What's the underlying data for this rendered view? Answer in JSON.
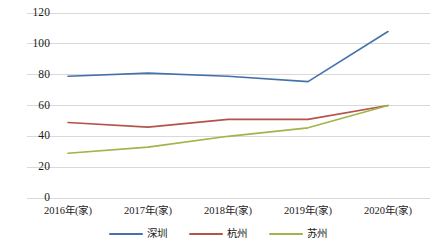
{
  "chart_data": {
    "type": "line",
    "title": "",
    "xlabel": "",
    "ylabel": "",
    "categories": [
      "2016年(家)",
      "2017年(家)",
      "2018年(家)",
      "2019年(家)",
      "2020年(家)"
    ],
    "series": [
      {
        "name": "深圳",
        "color": "#4472a8",
        "values": [
          79,
          81,
          79,
          75.5,
          108
        ]
      },
      {
        "name": "杭州",
        "color": "#b5534a",
        "values": [
          49,
          46,
          51,
          51,
          60
        ]
      },
      {
        "name": "苏州",
        "color": "#a0b44a",
        "values": [
          29,
          33,
          40,
          45.5,
          60
        ]
      }
    ],
    "ylim": [
      0,
      120
    ],
    "yticks": [
      "0",
      "20",
      "40",
      "60",
      "80",
      "100",
      "120"
    ],
    "ytick_values": [
      0,
      20,
      40,
      60,
      80,
      100,
      120
    ],
    "grid": true,
    "grid_color": "#d9d9d9",
    "legend_position": "bottom",
    "background": "#ffffff"
  }
}
